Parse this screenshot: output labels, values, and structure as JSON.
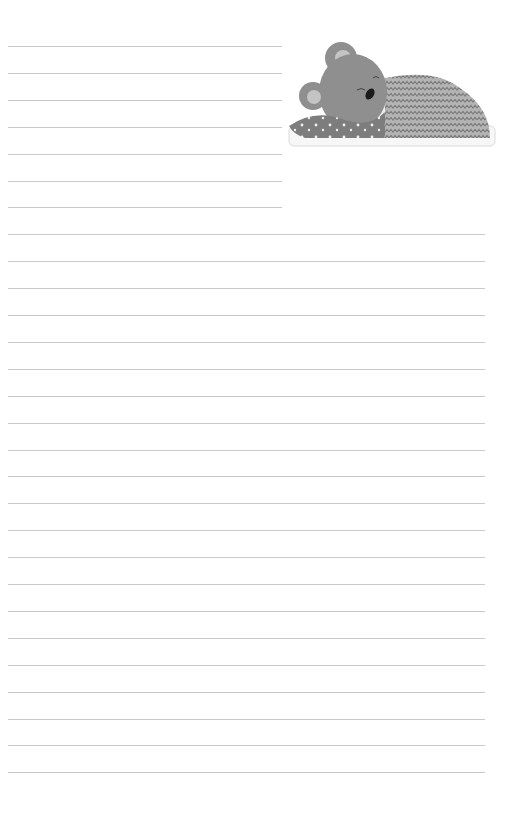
{
  "page": {
    "type": "lined-notebook-page",
    "background": "#ffffff",
    "rule_color": "#c9c9c9",
    "short_rules_count": 7,
    "full_rules_count": 21
  },
  "illustration": {
    "subject": "sleeping-bear-under-blanket",
    "colors": {
      "bear": "#8f8f8f",
      "ear_inner": "#c4c4c4",
      "blanket_star": "#7a7a7a",
      "blanket_zigzag": "#a8a8a8",
      "pillow": "#f2f2f2",
      "sheet": "#e6e6e6"
    }
  }
}
